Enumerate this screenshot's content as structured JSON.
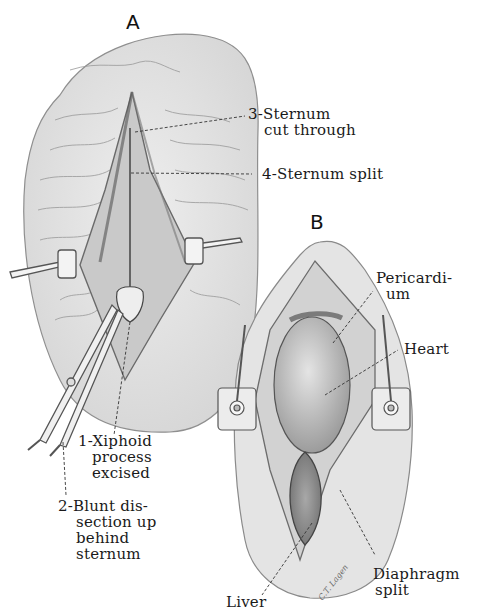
{
  "figure": {
    "panels": [
      {
        "id": "A",
        "letter": "A",
        "labels": [
          {
            "number": "3",
            "lines": [
              "3-Sternum",
              "cut through"
            ]
          },
          {
            "number": "4",
            "lines": [
              "4-Sternum split"
            ]
          },
          {
            "number": "1",
            "lines": [
              "1-Xiphoid",
              "process",
              "excised"
            ]
          },
          {
            "number": "2",
            "lines": [
              "2-Blunt dis-",
              "section up",
              "behind",
              "sternum"
            ]
          }
        ]
      },
      {
        "id": "B",
        "letter": "B",
        "labels": [
          {
            "lines": [
              "Pericardi-",
              "um"
            ]
          },
          {
            "lines": [
              "Heart"
            ]
          },
          {
            "lines": [
              "Liver"
            ]
          },
          {
            "lines": [
              "Diaphragm",
              "split"
            ]
          }
        ]
      }
    ],
    "signature": "C.T. Lagen",
    "colors": {
      "skin": "#e6e6e6",
      "skin_edge": "#8a8a8a",
      "tissue_dark": "#9a9a9a",
      "ink": "#1a1a1a"
    }
  }
}
